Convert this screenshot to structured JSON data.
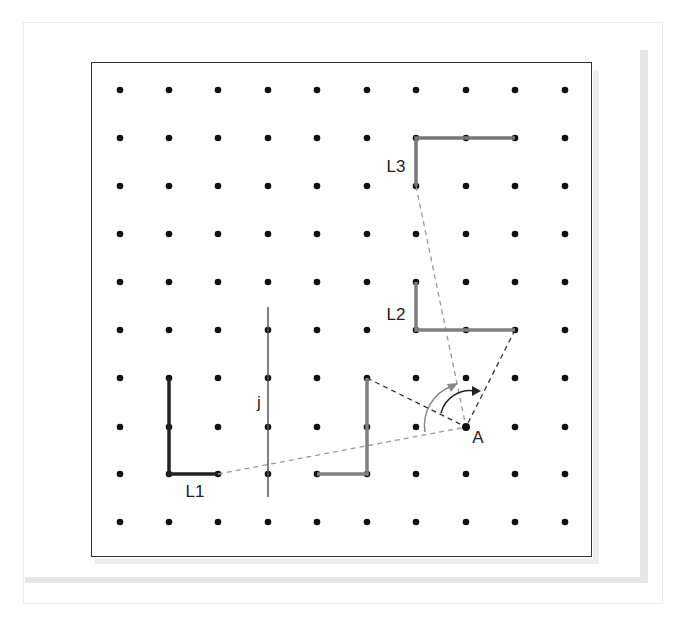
{
  "grid": {
    "columns_x": [
      120,
      169,
      218,
      268,
      317,
      367,
      416,
      466,
      515,
      565
    ],
    "rows_y": [
      90,
      138,
      186,
      234,
      282,
      330,
      378,
      427,
      474,
      522
    ]
  },
  "labels": {
    "L1": "L1",
    "L2": "L2",
    "L3": "L3",
    "j": "j",
    "A": "A"
  },
  "shapes": {
    "L1": {
      "color": "#222222",
      "points": [
        [
          169,
          378
        ],
        [
          169,
          474
        ],
        [
          218,
          474
        ]
      ]
    },
    "L_middle": {
      "color": "#808080",
      "points": [
        [
          367,
          378
        ],
        [
          367,
          474
        ],
        [
          317,
          474
        ]
      ]
    },
    "L2": {
      "color": "#808080",
      "points": [
        [
          416,
          282
        ],
        [
          416,
          330
        ],
        [
          515,
          330
        ]
      ]
    },
    "L3": {
      "color": "#777777",
      "points": [
        [
          416,
          186
        ],
        [
          416,
          138
        ],
        [
          515,
          138
        ]
      ]
    },
    "line_j": {
      "color": "#555555",
      "x": 268,
      "y1": 307,
      "y2": 497
    },
    "point_A": [
      466,
      427
    ]
  },
  "colors": {
    "dashed_light": "#999999",
    "dashed_dark": "#333333",
    "arc_outer": "#888888",
    "arc_inner": "#222222"
  }
}
